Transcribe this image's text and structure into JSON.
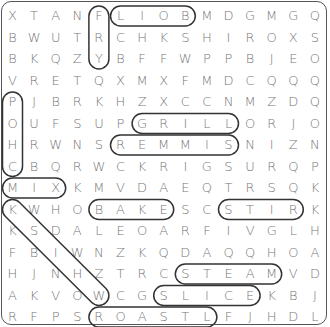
{
  "puzzle": {
    "rows": [
      "XTANFLIOBMDGMGQ",
      "BWUTRCHKSHIROXS",
      "BKQZYBFFWPPBJEO",
      "VRETQXMXFMDCQQQ",
      "PJBRKHZXCCNMZDQ",
      "OUFSUPGRILLORJO",
      "HRWNSREMMISNIZN",
      "CBQRWCKRIGSURQP",
      "MIXKMVDAEQTRSQK",
      "KWHOBAKESCSTIRK",
      "KSDALEOARFIVGLH",
      "FBIWNZKQDAQQHOA",
      "HJNHZTRCSTEAMVD",
      "AKVOWCGSLICEKBJ",
      "RFPSROASTLFJHDL"
    ],
    "found_words": [
      {
        "word": "FRY",
        "start": [
          0,
          4
        ],
        "end": [
          2,
          4
        ]
      },
      {
        "word": "BOIL",
        "start": [
          0,
          8
        ],
        "end": [
          0,
          5
        ]
      },
      {
        "word": "POACH",
        "start": [
          4,
          0
        ],
        "end": [
          7,
          0
        ]
      },
      {
        "word": "GRILL",
        "start": [
          5,
          6
        ],
        "end": [
          5,
          10
        ]
      },
      {
        "word": "SIMMER",
        "start": [
          6,
          10
        ],
        "end": [
          6,
          5
        ]
      },
      {
        "word": "MIX",
        "start": [
          8,
          0
        ],
        "end": [
          8,
          2
        ]
      },
      {
        "word": "BAKE",
        "start": [
          9,
          4
        ],
        "end": [
          9,
          7
        ]
      },
      {
        "word": "STIR",
        "start": [
          9,
          10
        ],
        "end": [
          9,
          13
        ]
      },
      {
        "word": "KSNOW",
        "start": [
          9,
          0
        ],
        "end": [
          13,
          4
        ]
      },
      {
        "word": "STEAM",
        "start": [
          12,
          8
        ],
        "end": [
          12,
          12
        ]
      },
      {
        "word": "SLICE",
        "start": [
          13,
          7
        ],
        "end": [
          13,
          11
        ]
      },
      {
        "word": "ROAST",
        "start": [
          14,
          4
        ],
        "end": [
          14,
          9
        ]
      }
    ]
  }
}
